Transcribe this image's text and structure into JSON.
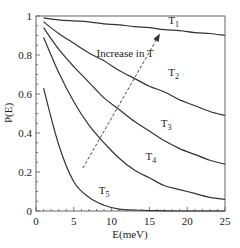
{
  "chart_data": {
    "type": "line",
    "title": "",
    "xlabel": "E(meV)",
    "ylabel": "P(E)",
    "xlim": [
      0,
      25
    ],
    "ylim": [
      0,
      1
    ],
    "xticks": [
      0,
      5,
      10,
      15,
      20,
      25
    ],
    "xtick_labels": [
      "0",
      "5",
      "10",
      "15",
      "20",
      "25"
    ],
    "yticks": [
      0,
      0.2,
      0.4,
      0.6,
      0.8,
      1
    ],
    "ytick_labels": [
      "0",
      "0.2",
      "0.4",
      "0.6",
      "0.8",
      "1"
    ],
    "grid": false,
    "legend": "none (inline curve labels)",
    "x": [
      1,
      3,
      5,
      7,
      9,
      11,
      13,
      15,
      17,
      19,
      21,
      23,
      25
    ],
    "series": [
      {
        "name": "T1",
        "label_main": "T",
        "label_sub": "1",
        "values": [
          0.99,
          0.98,
          0.975,
          0.97,
          0.96,
          0.955,
          0.945,
          0.94,
          0.93,
          0.925,
          0.915,
          0.91,
          0.9
        ]
      },
      {
        "name": "T2",
        "label_main": "T",
        "label_sub": "2",
        "values": [
          0.97,
          0.91,
          0.86,
          0.81,
          0.77,
          0.72,
          0.68,
          0.64,
          0.61,
          0.57,
          0.54,
          0.51,
          0.49
        ]
      },
      {
        "name": "T3",
        "label_main": "T",
        "label_sub": "3",
        "values": [
          0.94,
          0.83,
          0.74,
          0.66,
          0.58,
          0.52,
          0.46,
          0.41,
          0.36,
          0.32,
          0.29,
          0.26,
          0.24
        ]
      },
      {
        "name": "T4",
        "label_main": "T",
        "label_sub": "4",
        "values": [
          0.89,
          0.71,
          0.56,
          0.44,
          0.35,
          0.27,
          0.21,
          0.17,
          0.13,
          0.11,
          0.09,
          0.07,
          0.06
        ]
      },
      {
        "name": "T5",
        "label_main": "T",
        "label_sub": "5",
        "values": [
          0.63,
          0.34,
          0.15,
          0.07,
          0.03,
          0.01,
          0.005,
          0.002,
          0.001,
          0.0,
          0.0,
          0.0,
          0.0
        ]
      }
    ],
    "label_positions": [
      {
        "name": "T1",
        "E": 17.5,
        "P": 0.96
      },
      {
        "name": "T2",
        "E": 17.5,
        "P": 0.69
      },
      {
        "name": "T3",
        "E": 16.5,
        "P": 0.43
      },
      {
        "name": "T4",
        "E": 14.5,
        "P": 0.26
      },
      {
        "name": "T5",
        "E": 8.3,
        "P": 0.085
      }
    ],
    "annotations": [
      {
        "type": "dashed-arrow",
        "text": "Increase in T",
        "from": {
          "E": 6.2,
          "P": 0.22
        },
        "to": {
          "E": 16.4,
          "P": 0.91
        },
        "text_pos": {
          "E": 8.0,
          "P": 0.79
        }
      }
    ],
    "line_color": "#333333"
  }
}
